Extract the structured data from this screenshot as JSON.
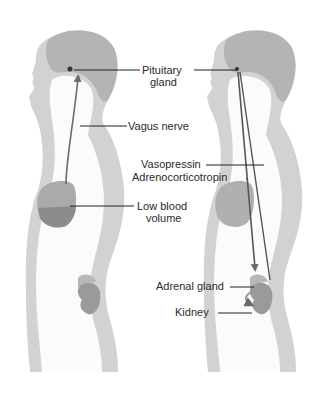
{
  "diagram": {
    "colors": {
      "body_fill": "#d2d2d2",
      "hair_fill": "#b4b4b4",
      "organ_fill": "#9a9a9a",
      "blood_fill": "#8c8c8c",
      "arrow": "#6a6a6a",
      "leader": "#222222"
    },
    "left_figure": {
      "labels": {
        "pituitary_line1": "Pituitary",
        "pituitary_line2": "gland",
        "vagus": "Vagus nerve",
        "low_blood_line1": "Low blood",
        "low_blood_line2": "volume"
      }
    },
    "right_figure": {
      "labels": {
        "vasopressin": "Vasopressin",
        "acth": "Adrenocorticotropin",
        "adrenal": "Adrenal gland",
        "kidney": "Kidney"
      }
    }
  }
}
